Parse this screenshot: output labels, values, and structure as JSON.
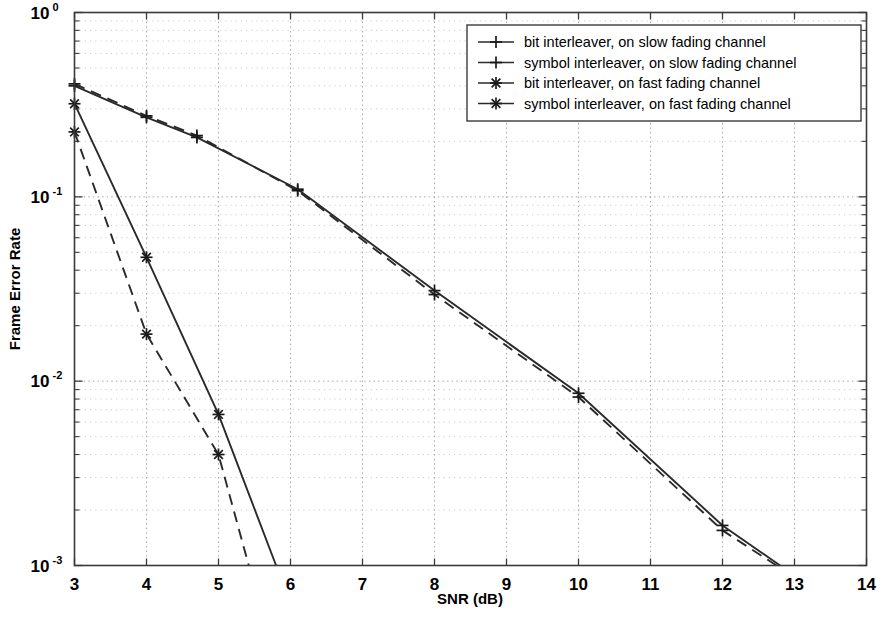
{
  "chart_data": {
    "type": "line",
    "title": "",
    "xlabel": "SNR (dB)",
    "ylabel": "Frame Error Rate",
    "xlim": [
      3,
      14
    ],
    "ylim": [
      0.001,
      1
    ],
    "yscale": "log",
    "xticks": [
      3,
      4,
      5,
      6,
      7,
      8,
      9,
      10,
      11,
      12,
      13,
      14
    ],
    "xtick_labels": [
      "3",
      "4",
      "5",
      "6",
      "7",
      "8",
      "9",
      "10",
      "11",
      "12",
      "13",
      "14"
    ],
    "yticks": [
      1,
      0.1,
      0.01,
      0.001
    ],
    "ytick_labels": [
      "10^0",
      "10^-1",
      "10^-2",
      "10^-3"
    ],
    "ytick_base": [
      "10",
      "10",
      "10",
      "10"
    ],
    "ytick_exp": [
      "0",
      "-1",
      "-2",
      "-3"
    ],
    "grid": true,
    "legend_position": "upper right",
    "series": [
      {
        "name": "bit interleaver, on slow fading channel",
        "style": "solid",
        "marker": "plus",
        "x": [
          3.0,
          4.0,
          4.7,
          6.1,
          8.0,
          10.0,
          12.0,
          12.8
        ],
        "y": [
          0.4,
          0.27,
          0.21,
          0.11,
          0.031,
          0.0086,
          0.00165,
          0.001
        ]
      },
      {
        "name": "symbol interleaver, on slow fading channel",
        "style": "dashed",
        "marker": "plus",
        "x": [
          3.0,
          4.0,
          4.7,
          6.1,
          8.0,
          10.0,
          12.0,
          12.75
        ],
        "y": [
          0.41,
          0.275,
          0.215,
          0.108,
          0.0295,
          0.0082,
          0.00155,
          0.001
        ]
      },
      {
        "name": "bit interleaver, on fast fading channel",
        "style": "solid",
        "marker": "star",
        "x": [
          3.0,
          4.0,
          5.0,
          5.8
        ],
        "y": [
          0.32,
          0.047,
          0.0066,
          0.001
        ]
      },
      {
        "name": "symbol interleaver, on fast fading channel",
        "style": "dashed",
        "marker": "star",
        "x": [
          3.0,
          4.0,
          5.0,
          5.42
        ],
        "y": [
          0.225,
          0.018,
          0.004,
          0.001
        ]
      }
    ],
    "legend_entries": [
      {
        "label": "bit interleaver, on slow fading channel",
        "style": "solid",
        "marker": "plus"
      },
      {
        "label": "symbol interleaver, on slow fading channel",
        "style": "solid",
        "marker": "plus"
      },
      {
        "label": "bit interleaver, on fast fading channel",
        "style": "solid",
        "marker": "star"
      },
      {
        "label": "symbol interleaver, on fast fading channel",
        "style": "solid",
        "marker": "star"
      }
    ],
    "colors": {
      "line": "#2a2a2a",
      "grid": "#9a9a9a",
      "frame": "#3a3a3a",
      "background": "#ffffff"
    }
  }
}
